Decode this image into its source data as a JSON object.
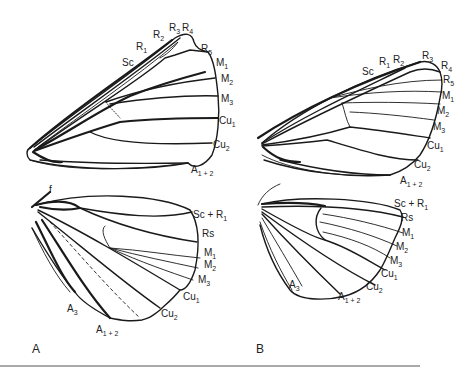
{
  "figure": {
    "panels": [
      {
        "id": "A",
        "label": "A",
        "label_pos": [
          32,
          353
        ],
        "forewing_labels": [
          {
            "base": "Sc",
            "sub": "",
            "x": 122,
            "y": 66
          },
          {
            "base": "R",
            "sub": "1",
            "x": 136,
            "y": 50
          },
          {
            "base": "R",
            "sub": "2",
            "x": 153,
            "y": 38
          },
          {
            "base": "R",
            "sub": "3",
            "x": 169,
            "y": 31
          },
          {
            "base": "R",
            "sub": "4",
            "x": 182,
            "y": 31
          },
          {
            "base": "R",
            "sub": "5",
            "x": 201,
            "y": 52
          },
          {
            "base": "M",
            "sub": "1",
            "x": 216,
            "y": 66
          },
          {
            "base": "M",
            "sub": "2",
            "x": 221,
            "y": 82
          },
          {
            "base": "M",
            "sub": "3",
            "x": 221,
            "y": 102
          },
          {
            "base": "Cu",
            "sub": "1",
            "x": 219,
            "y": 124
          },
          {
            "base": "Cu",
            "sub": "2",
            "x": 213,
            "y": 148
          },
          {
            "base": "A",
            "sub": "1 + 2",
            "x": 191,
            "y": 173
          }
        ],
        "hindwing_labels": [
          {
            "base": "f",
            "sub": "",
            "x": 49,
            "y": 193
          },
          {
            "base": "Sc + R",
            "sub": "1",
            "x": 193,
            "y": 218
          },
          {
            "base": "Rs",
            "sub": "",
            "x": 202,
            "y": 237
          },
          {
            "base": "M",
            "sub": "1",
            "x": 204,
            "y": 256
          },
          {
            "base": "M",
            "sub": "2",
            "x": 204,
            "y": 268
          },
          {
            "base": "M",
            "sub": "3",
            "x": 198,
            "y": 283
          },
          {
            "base": "Cu",
            "sub": "1",
            "x": 183,
            "y": 300
          },
          {
            "base": "Cu",
            "sub": "2",
            "x": 161,
            "y": 317
          },
          {
            "base": "A",
            "sub": "3",
            "x": 67,
            "y": 312
          },
          {
            "base": "A",
            "sub": "1 + 2",
            "x": 96,
            "y": 333
          }
        ]
      },
      {
        "id": "B",
        "label": "B",
        "label_pos": [
          256,
          353
        ],
        "forewing_labels": [
          {
            "base": "Sc",
            "sub": "",
            "x": 362,
            "y": 75
          },
          {
            "base": "R",
            "sub": "1",
            "x": 379,
            "y": 65
          },
          {
            "base": "R",
            "sub": "2",
            "x": 393,
            "y": 63
          },
          {
            "base": "R",
            "sub": "3",
            "x": 422,
            "y": 59
          },
          {
            "base": "R",
            "sub": "4",
            "x": 441,
            "y": 69
          },
          {
            "base": "R",
            "sub": "5",
            "x": 443,
            "y": 83
          },
          {
            "base": "M",
            "sub": "1",
            "x": 442,
            "y": 99
          },
          {
            "base": "M",
            "sub": "2",
            "x": 437,
            "y": 114
          },
          {
            "base": "M",
            "sub": "3",
            "x": 433,
            "y": 130
          },
          {
            "base": "Cu",
            "sub": "1",
            "x": 427,
            "y": 149
          },
          {
            "base": "Cu",
            "sub": "2",
            "x": 414,
            "y": 168
          },
          {
            "base": "A",
            "sub": "1 + 2",
            "x": 400,
            "y": 184
          }
        ],
        "hindwing_labels": [
          {
            "base": "Sc + R",
            "sub": "1",
            "x": 394,
            "y": 207
          },
          {
            "base": "Rs",
            "sub": "",
            "x": 401,
            "y": 221
          },
          {
            "base": "M",
            "sub": "1",
            "x": 402,
            "y": 236
          },
          {
            "base": "M",
            "sub": "2",
            "x": 396,
            "y": 250
          },
          {
            "base": "M",
            "sub": "3",
            "x": 390,
            "y": 264
          },
          {
            "base": "Cu",
            "sub": "1",
            "x": 381,
            "y": 277
          },
          {
            "base": "Cu",
            "sub": "2",
            "x": 366,
            "y": 290
          },
          {
            "base": "A",
            "sub": "3",
            "x": 289,
            "y": 288
          },
          {
            "base": "A",
            "sub": "1 + 2",
            "x": 338,
            "y": 300
          }
        ]
      }
    ],
    "colors": {
      "background": "#ffffff",
      "line": "#1a1a1a",
      "text": "#222222",
      "rule": "#555555"
    }
  }
}
